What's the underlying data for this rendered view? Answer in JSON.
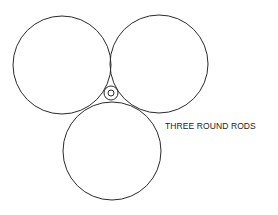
{
  "diagram": {
    "label": "THREE ROUND RODS",
    "stroke_color": "#2a2a2a",
    "background": "#ffffff",
    "rods": [
      {
        "name": "left-rod",
        "cx": 62,
        "cy": 65,
        "r": 49
      },
      {
        "name": "right-rod",
        "cx": 159,
        "cy": 64,
        "r": 49
      },
      {
        "name": "bottom-rod",
        "cx": 112,
        "cy": 151,
        "r": 49
      }
    ],
    "center_rod": {
      "cx": 111,
      "cy": 93,
      "r_outer": 7,
      "r_inner": 3
    }
  }
}
